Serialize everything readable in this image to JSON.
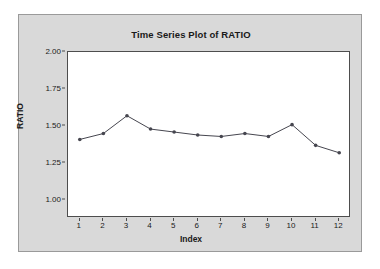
{
  "page": {
    "background_color": "#ffffff",
    "panel_color": "#d9d9d9",
    "plot_background_color": "#ffffff",
    "axis_color": "#4d4d4d",
    "series_color": "#46464f"
  },
  "chart_data": {
    "type": "line",
    "title": "Time Series Plot of RATIO",
    "xlabel": "Index",
    "ylabel": "RATIO",
    "x": [
      1,
      2,
      3,
      4,
      5,
      6,
      7,
      8,
      9,
      10,
      11,
      12
    ],
    "values": [
      1.41,
      1.45,
      1.57,
      1.48,
      1.46,
      1.44,
      1.43,
      1.45,
      1.43,
      1.51,
      1.37,
      1.32
    ],
    "series": [
      {
        "name": "RATIO",
        "values": [
          1.41,
          1.45,
          1.57,
          1.48,
          1.46,
          1.44,
          1.43,
          1.45,
          1.43,
          1.51,
          1.37,
          1.32
        ]
      }
    ],
    "xlim": [
      0.5,
      12.5
    ],
    "ylim": [
      0.88,
      2.0
    ],
    "ytick_labels": [
      "2.00",
      "1.75",
      "1.50",
      "1.25",
      "1.00"
    ],
    "ytick_values": [
      2.0,
      1.75,
      1.5,
      1.25,
      1.0
    ],
    "xtick_labels": [
      "1",
      "2",
      "3",
      "4",
      "5",
      "6",
      "7",
      "8",
      "9",
      "10",
      "11",
      "12"
    ],
    "grid": false,
    "legend": "none",
    "marker": "filled-circle"
  }
}
